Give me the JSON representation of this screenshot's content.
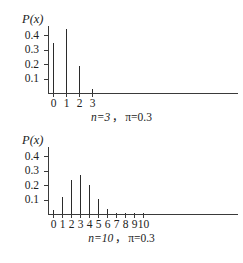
{
  "figure": {
    "background": "#ffffff",
    "ink": "#2b2b2b"
  },
  "charts": [
    {
      "id": "top",
      "ylabel": "P(x)",
      "caption_n": "n=3",
      "caption_sep": "，",
      "caption_pi": "π=0.3",
      "caption_full": "n=3， π=0.3"
    },
    {
      "id": "bottom",
      "ylabel": "P(x)",
      "caption_n": "n=10",
      "caption_sep": "，",
      "caption_pi": "π=0.3",
      "caption_full": "n=10， π=0.3"
    }
  ],
  "chart_data": [
    {
      "type": "bar",
      "subtype": "needle-spike",
      "title": "",
      "caption": "n=3， π=0.3",
      "xlabel": "",
      "ylabel": "P(x)",
      "distribution": "binomial",
      "params": {
        "n": 3,
        "pi": 0.3
      },
      "categories": [
        "0",
        "1",
        "2",
        "3"
      ],
      "x": [
        0,
        1,
        2,
        3
      ],
      "values": [
        0.343,
        0.441,
        0.189,
        0.027
      ],
      "yticks": [
        0.1,
        0.2,
        0.3,
        0.4
      ],
      "ytick_labels": [
        "0.1",
        "0.2",
        "0.3",
        "0.4"
      ],
      "ylim": [
        0,
        0.47
      ],
      "xlim": [
        -0.5,
        21
      ],
      "grid": false,
      "legend": false
    },
    {
      "type": "bar",
      "subtype": "needle-spike",
      "title": "",
      "caption": "n=10， π=0.3",
      "xlabel": "",
      "ylabel": "P(x)",
      "distribution": "binomial",
      "params": {
        "n": 10,
        "pi": 0.3
      },
      "categories": [
        "0",
        "1",
        "2",
        "3",
        "4",
        "5",
        "6",
        "7",
        "8",
        "9",
        "10"
      ],
      "x": [
        0,
        1,
        2,
        3,
        4,
        5,
        6,
        7,
        8,
        9,
        10
      ],
      "values": [
        0.028,
        0.121,
        0.233,
        0.267,
        0.2,
        0.103,
        0.037,
        0.009,
        0.0014,
        0.0001,
        6e-06
      ],
      "yticks": [
        0.1,
        0.2,
        0.3,
        0.4
      ],
      "ytick_labels": [
        "0.1",
        "0.2",
        "0.3",
        "0.4"
      ],
      "ylim": [
        0,
        0.47
      ],
      "xlim": [
        -0.5,
        21
      ],
      "grid": false,
      "legend": false
    }
  ]
}
